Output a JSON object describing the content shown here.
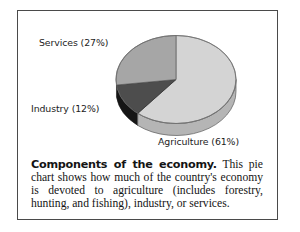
{
  "figure": {
    "caption_lead": "Components of the economy.",
    "caption_body": " This pie chart shows how much of the country's economy is devoted to agriculture (includes forestry, hunting, and fishing), industry, or services."
  },
  "labels": {
    "services": "Services (27%)",
    "industry": "Industry (12%)",
    "agriculture": "Agriculture (61%)"
  },
  "chart_data": {
    "type": "pie",
    "title": "Components of the economy",
    "categories": [
      "Agriculture",
      "Industry",
      "Services"
    ],
    "values": [
      61,
      12,
      27
    ],
    "unit": "%",
    "labels": [
      "Agriculture (61%)",
      "Industry (12%)",
      "Services (27%)"
    ],
    "colors": [
      "#d4d4d4",
      "#4d4d4d",
      "#a6a6a6"
    ],
    "start_angle_deg": 0,
    "direction": "clockwise",
    "three_d": true,
    "legend": "labels-outside",
    "grid": false,
    "xlabel": "",
    "ylabel": ""
  },
  "style": {
    "frame_color": "#4a4a4a",
    "agriculture_color": "#d4d4d4",
    "industry_color": "#4d4d4d",
    "services_color": "#a6a6a6",
    "side_agriculture": "#b5b5b5",
    "side_industry": "#151515",
    "side_services": "#8a8a8a",
    "text_color": "#141414"
  }
}
